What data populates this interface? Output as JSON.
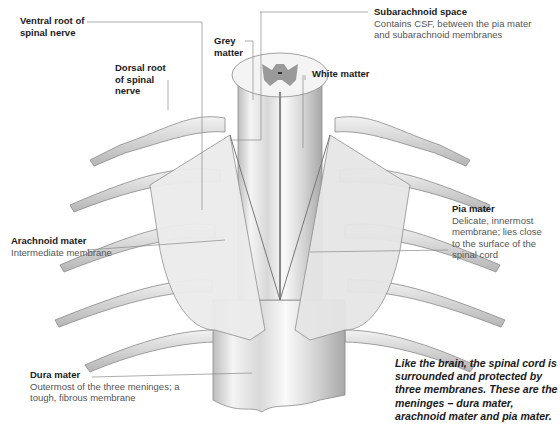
{
  "diagram": {
    "labels": {
      "ventral_root": {
        "title": "Ventral root of spinal nerve"
      },
      "dorsal_root": {
        "title": "Dorsal root of spinal nerve"
      },
      "grey_matter": {
        "title": "Grey matter"
      },
      "white_matter": {
        "title": "White matter"
      },
      "subarachnoid": {
        "title": "Subarachnoid space",
        "desc": "Contains CSF, between the pia mater and subarachnoid membranes"
      },
      "pia": {
        "title": "Pia mater",
        "desc": "Delicate, innermost membrane; lies close to the surface of the spinal cord"
      },
      "arachnoid": {
        "title": "Arachnoid mater",
        "desc": "Intermediate membrane"
      },
      "dura": {
        "title": "Dura mater",
        "desc": "Outermost of the three meninges; a tough, fibrous membrane"
      }
    },
    "note": "Like the brain, the spinal cord is surrounded and protected by three membranes. These are the meninges – dura mater, arachnoid mater and pia mater.",
    "colors": {
      "leader_line": "#8a8a8a",
      "grey_matter": "#9a9a9a",
      "tissue_light": "#f2f2f2",
      "tissue_shadow": "#b8b8b8",
      "outline": "#7a7a7a"
    }
  }
}
